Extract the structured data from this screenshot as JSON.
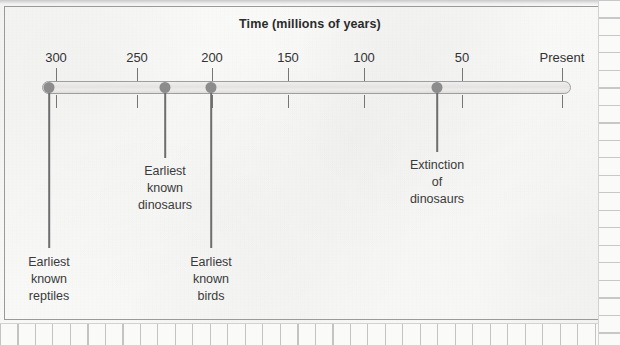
{
  "figure": {
    "title": "Time (millions of years)",
    "axis_line_color": "#9e9e9e",
    "marker_color": "#8c8c8c",
    "text_color": "#3a3a3a"
  },
  "chart_data": {
    "type": "line",
    "title": "Time (millions of years)",
    "xlabel": "Time (millions of years)",
    "ylabel": "",
    "grid": false,
    "legend": "none",
    "axis_direction": "decreasing",
    "xlim": [
      300,
      0
    ],
    "tick_labels": [
      "300",
      "250",
      "200",
      "150",
      "100",
      "50",
      "Present"
    ],
    "tick_values": [
      300,
      250,
      200,
      150,
      100,
      50,
      0
    ],
    "tick_pixel_x": [
      56,
      137,
      212,
      288,
      364,
      462,
      562
    ],
    "events": [
      {
        "label": "Earliest\nknown\nreptiles",
        "label_lines": [
          "Earliest",
          "known",
          "reptiles"
        ],
        "value_mya": 315,
        "pixel_x": 49,
        "leader_end_y": 248,
        "label_top_y": 254
      },
      {
        "label": "Earliest\nknown\ndinosaurs",
        "label_lines": [
          "Earliest",
          "known",
          "dinosaurs"
        ],
        "value_mya": 235,
        "pixel_x": 165,
        "leader_end_y": 158,
        "label_top_y": 163
      },
      {
        "label": "Earliest\nknown\nbirds",
        "label_lines": [
          "Earliest",
          "known",
          "birds"
        ],
        "value_mya": 200,
        "pixel_x": 211,
        "leader_end_y": 248,
        "label_top_y": 254
      },
      {
        "label": "Extinction\nof\ndinosaurs",
        "label_lines": [
          "Extinction",
          "of",
          "dinosaurs"
        ],
        "value_mya": 65,
        "pixel_x": 437,
        "leader_end_y": 152,
        "label_top_y": 157
      }
    ]
  }
}
